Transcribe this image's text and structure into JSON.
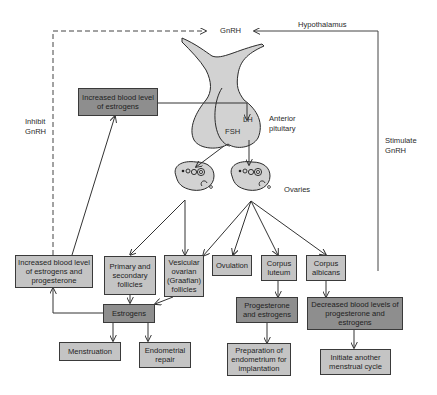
{
  "diagram": {
    "colors": {
      "light_box": "#c4c4c4",
      "dark_box": "#8e8e8e",
      "gland_fill": "#d2d2d2",
      "line": "#333333"
    },
    "labels": {
      "gnrh": "GnRH",
      "hypothalamus": "Hypothalamus",
      "anterior_pituitary_1": "Anterior",
      "anterior_pituitary_2": "pituitary",
      "lh": "LH",
      "fsh": "FSH",
      "ovaries": "Ovaries",
      "inhibit_1": "Inhibit",
      "inhibit_2": "GnRH",
      "stimulate_1": "Stimulate",
      "stimulate_2": "GnRH"
    },
    "boxes": {
      "increased_estrogens": "Increased blood level of estrogens",
      "increased_estrogens_progesterone": "Increased blood level of estrogens and progesterone",
      "primary_secondary_follicles": "Primary and secondary follicles",
      "vesicular_follicles": "Vesicular ovarian (Graafian) follicles",
      "ovulation": "Ovulation",
      "corpus_luteum": "Corpus luteum",
      "corpus_albicans": "Corpus albicans",
      "estrogens": "Estrogens",
      "progesterone_estrogens": "Progesterone and estrogens",
      "decreased_levels": "Decreased blood levels of progesterone and estrogens",
      "menstruation": "Menstruation",
      "endometrial_repair": "Endometrial repair",
      "preparation_endometrium": "Preparation of endometrium for implantation",
      "initiate_cycle": "Initiate another menstrual cycle"
    }
  }
}
